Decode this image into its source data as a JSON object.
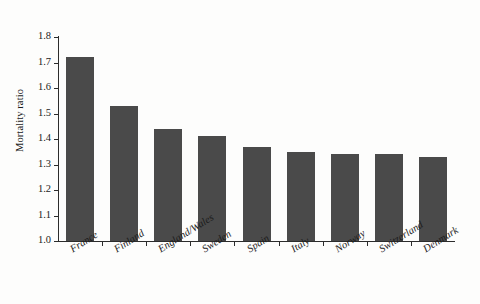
{
  "chart_data": {
    "type": "bar",
    "title": "",
    "xlabel": "",
    "ylabel": "Mortality ratio",
    "categories": [
      "France",
      "Finland",
      "England/Wales",
      "Sweden",
      "Spain",
      "Italy",
      "Norway",
      "Switzerland",
      "Denmark"
    ],
    "values": [
      1.72,
      1.53,
      1.44,
      1.41,
      1.37,
      1.35,
      1.34,
      1.34,
      1.33
    ],
    "ylim": [
      1.0,
      1.8
    ],
    "yticks": [
      "1.0",
      "1.1",
      "1.2",
      "1.3",
      "1.4",
      "1.5",
      "1.6",
      "1.7",
      "1.8"
    ],
    "ytick_values": [
      1.0,
      1.1,
      1.2,
      1.3,
      1.4,
      1.5,
      1.6,
      1.7,
      1.8
    ],
    "grid": false,
    "legend": "none",
    "bar_color": "#4a4a4a",
    "axis_color": "#2c2c2c",
    "background": "#fdfdfc"
  }
}
